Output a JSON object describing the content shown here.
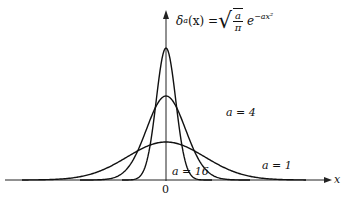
{
  "chart_data": {
    "type": "line",
    "xlabel": "x",
    "ylabel": "",
    "x_tick_labels": [
      "0"
    ],
    "grid": false,
    "legend": "none (curves labeled inline)",
    "series": [
      {
        "name": "a = 16",
        "a": 16,
        "peak_height_px": 132,
        "annotation": "a = 16"
      },
      {
        "name": "a = 4",
        "a": 4,
        "peak_height_px": 84,
        "annotation": "a = 4"
      },
      {
        "name": "a = 1",
        "a": 1,
        "peak_height_px": 38,
        "annotation": "a = 1"
      }
    ],
    "xlim": [
      -3,
      3
    ],
    "note": "Gaussian family approaching Dirac delta as a increases"
  },
  "labels": {
    "title_lhs": "δ",
    "title_sub": "a",
    "title_arg": "(x) =",
    "title_frac_num": "a",
    "title_frac_den": "π",
    "title_e": "e",
    "title_exp": "−ax²",
    "x_axis": "x",
    "origin": "0",
    "curve_a16": "a = 16",
    "curve_a4": "a = 4",
    "curve_a1": "a = 1"
  },
  "geometry": {
    "origin_x": 166,
    "baseline_y": 180,
    "axis_top_y": 10,
    "x_left": 5,
    "x_right": 330
  }
}
